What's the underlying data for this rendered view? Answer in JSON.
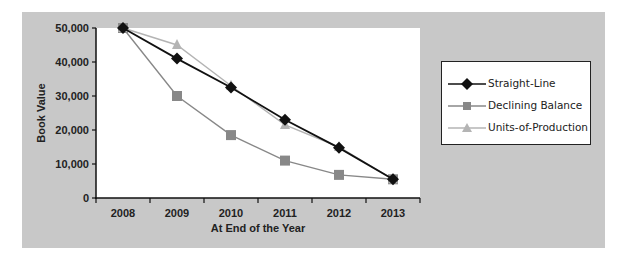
{
  "chart_data": {
    "type": "line",
    "title": "",
    "xlabel": "At End of the Year",
    "ylabel": "Book Value",
    "categories": [
      "2008",
      "2009",
      "2010",
      "2011",
      "2012",
      "2013"
    ],
    "y_ticks": [
      "0",
      "10,000",
      "20,000",
      "30,000",
      "40,000",
      "50,000"
    ],
    "ylim": [
      0,
      50000
    ],
    "grid": false,
    "legend_position": "right",
    "series": [
      {
        "name": "Straight-Line",
        "marker": "diamond",
        "color": "#111111",
        "values": [
          50000,
          41000,
          32500,
          23000,
          14750,
          5500
        ]
      },
      {
        "name": "Declining Balance",
        "marker": "square",
        "color": "#888888",
        "values": [
          50000,
          30000,
          18500,
          11000,
          6800,
          5500
        ]
      },
      {
        "name": "Units-of-Production",
        "marker": "triangle",
        "color": "#b4b4b4",
        "values": [
          50000,
          45000,
          33000,
          21500,
          15000,
          5500
        ]
      }
    ]
  },
  "legend": {
    "items": [
      {
        "label": "Straight-Line"
      },
      {
        "label": "Declining Balance"
      },
      {
        "label": "Units-of-Production"
      }
    ]
  }
}
